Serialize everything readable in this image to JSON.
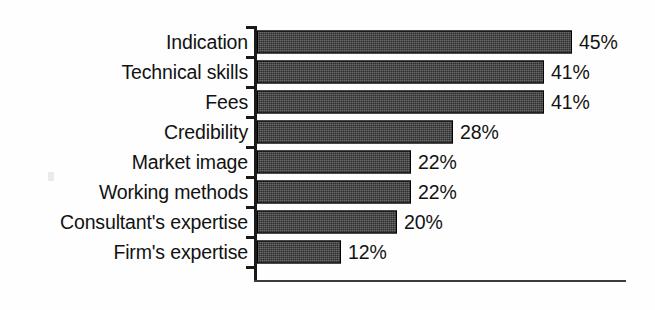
{
  "chart_data": {
    "type": "bar",
    "orientation": "horizontal",
    "title": "",
    "subtitle": "",
    "xlabel": "",
    "ylabel": "",
    "xlim": [
      0,
      45
    ],
    "grid": false,
    "legend": null,
    "value_suffix": "%",
    "categories": [
      "Indication",
      "Technical skills",
      "Fees",
      "Credibility",
      "Market image",
      "Working methods",
      "Consultant's expertise",
      "Firm's expertise"
    ],
    "values": [
      45,
      41,
      41,
      28,
      22,
      22,
      20,
      12
    ],
    "value_labels": [
      "45%",
      "41%",
      "41%",
      "28%",
      "22%",
      "22%",
      "20%",
      "12%"
    ],
    "colors": {
      "bar_fill": "#2e2e2e",
      "bar_border": "#000000",
      "axis": "#1a1a1a",
      "text": "#121212",
      "background": "#fefefe"
    },
    "axis": {
      "x_ticks_visible": false,
      "y_ticks_visible": true,
      "baseline_visible": true
    }
  },
  "bars": [
    {
      "label": "Indication",
      "value": 45,
      "value_label": "45%"
    },
    {
      "label": "Technical skills",
      "value": 41,
      "value_label": "41%"
    },
    {
      "label": "Fees",
      "value": 41,
      "value_label": "41%"
    },
    {
      "label": "Credibility",
      "value": 28,
      "value_label": "28%"
    },
    {
      "label": "Market image",
      "value": 22,
      "value_label": "22%"
    },
    {
      "label": "Working methods",
      "value": 22,
      "value_label": "22%"
    },
    {
      "label": "Consultant's expertise",
      "value": 20,
      "value_label": "20%"
    },
    {
      "label": "Firm's expertise",
      "value": 12,
      "value_label": "12%"
    }
  ],
  "scale": {
    "px_per_unit": 7.0,
    "row_pitch_px": 30,
    "first_row_top_px": 27,
    "bar_height_px": 23,
    "axis_left_px": 254,
    "baseline_top_px": 280,
    "baseline_width_px": 372
  }
}
